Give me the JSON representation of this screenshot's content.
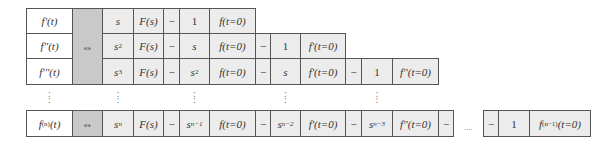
{
  "table": {
    "equivalence_symbol": "⇔",
    "ellipsis": "....",
    "vertical_dots": ":",
    "rows": [
      {
        "lhs": "f'(t)",
        "terms": [
          "s",
          "F(s)",
          "−",
          "1",
          "f(t=0)"
        ]
      },
      {
        "lhs": "f''(t)",
        "terms": [
          "s",
          "F(s)",
          "−",
          "s",
          "f(t=0)",
          "−",
          "1",
          "f'(t=0)"
        ],
        "s_exp": "2"
      },
      {
        "lhs": "f'''(t)",
        "terms": [
          "s",
          "F(s)",
          "−",
          "s",
          "f(t=0)",
          "−",
          "s",
          "f'(t=0)",
          "−",
          "1",
          "f''(t=0)"
        ],
        "s_exp": "3",
        "s2_exp": "2"
      },
      {
        "lhs_base": "f",
        "lhs_exp": "(n)",
        "lhs_arg": "(t)",
        "terms": [
          "s",
          "F(s)",
          "−",
          "s",
          "f(t=0)",
          "−",
          "s",
          "f'(t=0)",
          "−",
          "s",
          "f''(t=0)",
          "−",
          "....",
          "−",
          "1",
          "f",
          "(t=0)"
        ],
        "s_exp": "n",
        "s1_exp": "n−1",
        "s2_exp": "n−2",
        "s3_exp": "n−3",
        "last_exp": "(n−1)"
      }
    ]
  }
}
